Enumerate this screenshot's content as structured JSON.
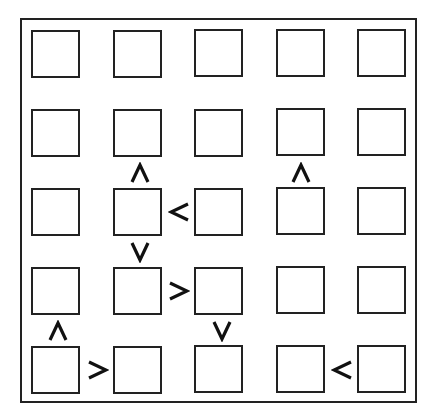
{
  "puzzle": {
    "type": "futoshiki",
    "size": 5,
    "grid": [
      [
        "",
        "",
        "",
        "",
        ""
      ],
      [
        "",
        "",
        "",
        "",
        ""
      ],
      [
        "",
        "",
        "",
        "",
        ""
      ],
      [
        "",
        "",
        "",
        "",
        ""
      ],
      [
        "",
        "",
        "",
        "",
        ""
      ]
    ],
    "constraints": [
      {
        "between": [
          [
            2,
            2
          ],
          [
            3,
            2
          ]
        ],
        "symbol": "∧",
        "meaning": "upper < lower"
      },
      {
        "between": [
          [
            2,
            4
          ],
          [
            3,
            4
          ]
        ],
        "symbol": "∧",
        "meaning": "upper < lower"
      },
      {
        "between": [
          [
            3,
            2
          ],
          [
            3,
            3
          ]
        ],
        "symbol": "<",
        "meaning": "left < right"
      },
      {
        "between": [
          [
            3,
            2
          ],
          [
            4,
            2
          ]
        ],
        "symbol": "∨",
        "meaning": "upper > lower"
      },
      {
        "between": [
          [
            4,
            2
          ],
          [
            4,
            3
          ]
        ],
        "symbol": ">",
        "meaning": "left > right"
      },
      {
        "between": [
          [
            4,
            1
          ],
          [
            5,
            1
          ]
        ],
        "symbol": "∧",
        "meaning": "upper < lower"
      },
      {
        "between": [
          [
            4,
            3
          ],
          [
            5,
            3
          ]
        ],
        "symbol": "∨",
        "meaning": "upper > lower"
      },
      {
        "between": [
          [
            5,
            1
          ],
          [
            5,
            2
          ]
        ],
        "symbol": ">",
        "meaning": "left > right"
      },
      {
        "between": [
          [
            5,
            4
          ],
          [
            5,
            5
          ]
        ],
        "symbol": "<",
        "meaning": "left < right"
      }
    ]
  },
  "colors": {
    "line": "#222222",
    "background": "#ffffff"
  }
}
